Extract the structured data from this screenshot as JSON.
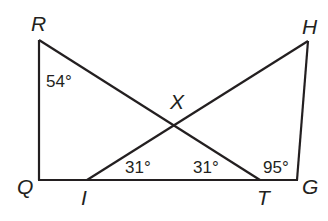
{
  "diagram": {
    "points": {
      "R": {
        "label": "R",
        "x": 39,
        "y": 40
      },
      "Q": {
        "label": "Q",
        "x": 39,
        "y": 180
      },
      "I": {
        "label": "I",
        "x": 87,
        "y": 180
      },
      "T": {
        "label": "T",
        "x": 260,
        "y": 180
      },
      "G": {
        "label": "G",
        "x": 297,
        "y": 180
      },
      "H": {
        "label": "H",
        "x": 308,
        "y": 41
      },
      "X": {
        "label": "X",
        "x": 174,
        "y": 96
      }
    },
    "segments": [
      "RQ",
      "QG",
      "RT",
      "IH",
      "HG"
    ],
    "angles": {
      "R": "54°",
      "XIT": "31°",
      "XTI": "31°",
      "HTG": "95°"
    }
  }
}
